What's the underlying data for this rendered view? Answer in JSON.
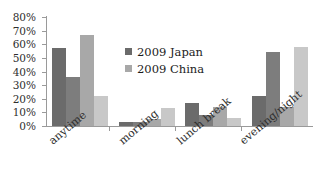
{
  "chart_data": {
    "type": "bar",
    "title": "",
    "xlabel": "",
    "ylabel": "",
    "categories": [
      "anytime",
      "morning",
      "lunch break",
      "evening/night"
    ],
    "ylim": [
      0,
      80
    ],
    "ytick_labels": [
      "0%",
      "10%",
      "20%",
      "30%",
      "40%",
      "50%",
      "60%",
      "70%",
      "80%"
    ],
    "ytick_values": [
      0,
      10,
      20,
      30,
      40,
      50,
      60,
      70,
      80
    ],
    "grid": false,
    "legend_position": "center",
    "series": [
      {
        "name": "2009 Japan",
        "color": "#6b6b6b",
        "values": [
          57,
          3,
          17,
          22
        ]
      },
      {
        "name": "2009 Japan b",
        "color": "#7d7d7d",
        "values": [
          36,
          3,
          8,
          54
        ]
      },
      {
        "name": "2009 China",
        "color": "#a8a8a8",
        "values": [
          67,
          5,
          14,
          14
        ]
      },
      {
        "name": "2009 China b",
        "color": "#c8c8c8",
        "values": [
          22,
          13,
          6,
          58
        ]
      }
    ],
    "legend": [
      {
        "label": "2009 Japan",
        "color": "#6b6b6b"
      },
      {
        "label": "2009 China",
        "color": "#a8a8a8"
      }
    ]
  }
}
